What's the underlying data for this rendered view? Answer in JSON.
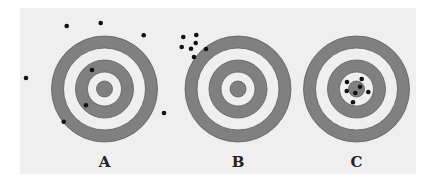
{
  "figure": {
    "panel": {
      "x": 20,
      "y": 8,
      "width": 396,
      "height": 166,
      "color": "#efefef"
    },
    "ring_colors": {
      "dark": "#808080",
      "stroke": "#5e5e5e",
      "light": "#efefef"
    },
    "ring_radii": [
      53,
      41,
      29,
      17,
      8
    ],
    "dot_color": "#111111",
    "dot_radius": 2.3,
    "targets": [
      {
        "label": "A",
        "cx": 104.5,
        "cy": 89,
        "label_y": 167,
        "dots": [
          [
            66.7,
            26
          ],
          [
            100.7,
            23
          ],
          [
            143.7,
            35.3
          ],
          [
            26,
            78
          ],
          [
            92,
            70
          ],
          [
            86,
            105.3
          ],
          [
            63.7,
            121.7
          ],
          [
            164,
            113
          ]
        ]
      },
      {
        "label": "B",
        "cx": 238,
        "cy": 89,
        "label_y": 167,
        "dots": [
          [
            183.3,
            37
          ],
          [
            196.3,
            35
          ],
          [
            181.7,
            47
          ],
          [
            191,
            48.7
          ],
          [
            195.7,
            43
          ],
          [
            206,
            49
          ],
          [
            194,
            57
          ]
        ]
      },
      {
        "label": "C",
        "cx": 356.5,
        "cy": 89,
        "label_y": 167,
        "dots": [
          [
            347,
            82
          ],
          [
            361.7,
            79
          ],
          [
            360,
            86.7
          ],
          [
            346.7,
            91
          ],
          [
            355.3,
            93
          ],
          [
            368.3,
            92
          ],
          [
            353,
            102.3
          ]
        ]
      }
    ]
  }
}
